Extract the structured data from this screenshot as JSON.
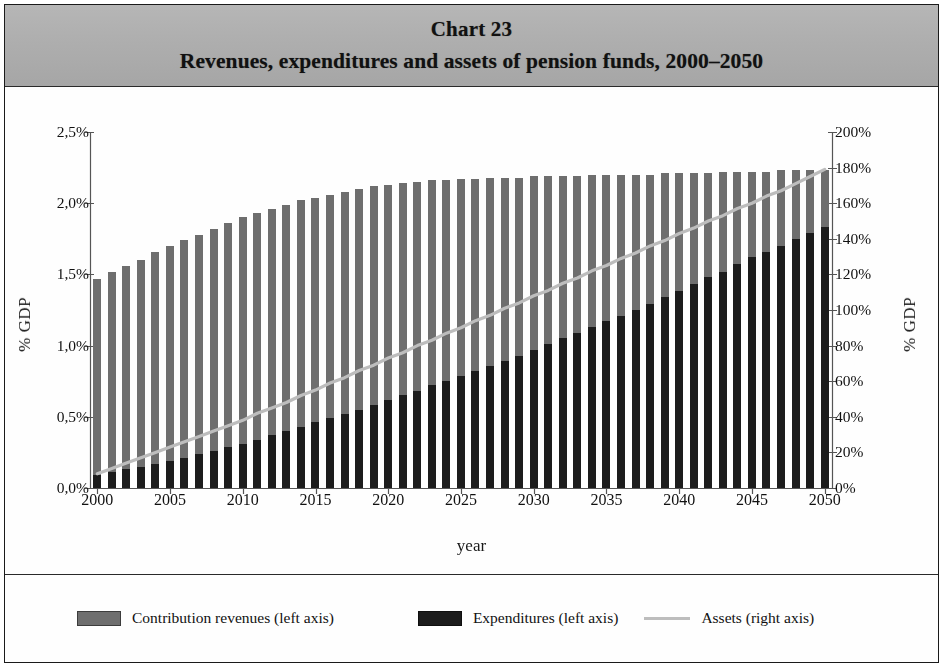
{
  "figure": {
    "title_line1": "Chart 23",
    "title_line2": "Revenues, expenditures and assets of pension funds, 2000–2050"
  },
  "axes": {
    "y_left_title": "% GDP",
    "y_right_title": "% GDP",
    "x_title": "year"
  },
  "legend": {
    "revenues_label": "Contribution revenues (left axis)",
    "expenditures_label": "Expenditures (left axis)",
    "assets_label": "Assets (right axis)"
  },
  "colors": {
    "revenues": "#6e6e6e",
    "expenditures": "#1c1c1c",
    "assets": "#bdbdbd",
    "banner": "#aeaeae",
    "frame": "#1a1a1a",
    "axis": "#555555"
  },
  "chart_data": {
    "type": "bar",
    "title": "Revenues, expenditures and assets of pension funds, 2000–2050",
    "xlabel": "year",
    "ylabel": "% GDP",
    "y2label": "% GDP",
    "grid": false,
    "legend_position": "bottom",
    "bar_mode": "overlay",
    "ylim": [
      0,
      2.5
    ],
    "y2lim": [
      0,
      200
    ],
    "y_ticks": [
      "0,0%",
      "0,5%",
      "1,0%",
      "1,5%",
      "2,0%",
      "2,5%"
    ],
    "y_tick_values": [
      0,
      0.5,
      1.0,
      1.5,
      2.0,
      2.5
    ],
    "y2_ticks": [
      "0%",
      "20%",
      "40%",
      "60%",
      "80%",
      "100%",
      "120%",
      "140%",
      "160%",
      "180%",
      "200%"
    ],
    "y2_tick_values": [
      0,
      20,
      40,
      60,
      80,
      100,
      120,
      140,
      160,
      180,
      200
    ],
    "x_tick_labels": [
      "2000",
      "2005",
      "2010",
      "2015",
      "2020",
      "2025",
      "2030",
      "2035",
      "2040",
      "2045",
      "2050"
    ],
    "x_tick_values": [
      2000,
      2005,
      2010,
      2015,
      2020,
      2025,
      2030,
      2035,
      2040,
      2045,
      2050
    ],
    "categories": [
      2000,
      2001,
      2002,
      2003,
      2004,
      2005,
      2006,
      2007,
      2008,
      2009,
      2010,
      2011,
      2012,
      2013,
      2014,
      2015,
      2016,
      2017,
      2018,
      2019,
      2020,
      2021,
      2022,
      2023,
      2024,
      2025,
      2026,
      2027,
      2028,
      2029,
      2030,
      2031,
      2032,
      2033,
      2034,
      2035,
      2036,
      2037,
      2038,
      2039,
      2040,
      2041,
      2042,
      2043,
      2044,
      2045,
      2046,
      2047,
      2048,
      2049,
      2050
    ],
    "series": [
      {
        "name": "Contribution revenues (left axis)",
        "axis": "left",
        "unit": "% GDP",
        "color": "#6e6e6e",
        "values": [
          1.47,
          1.52,
          1.56,
          1.6,
          1.66,
          1.7,
          1.74,
          1.78,
          1.82,
          1.86,
          1.9,
          1.93,
          1.96,
          1.99,
          2.02,
          2.04,
          2.06,
          2.08,
          2.1,
          2.12,
          2.13,
          2.14,
          2.15,
          2.16,
          2.16,
          2.17,
          2.17,
          2.18,
          2.18,
          2.18,
          2.19,
          2.19,
          2.19,
          2.19,
          2.2,
          2.2,
          2.2,
          2.2,
          2.2,
          2.21,
          2.21,
          2.21,
          2.21,
          2.22,
          2.22,
          2.22,
          2.22,
          2.23,
          2.23,
          2.23,
          2.23
        ]
      },
      {
        "name": "Expenditures (left axis)",
        "axis": "left",
        "unit": "% GDP",
        "color": "#1c1c1c",
        "values": [
          0.09,
          0.11,
          0.13,
          0.15,
          0.17,
          0.19,
          0.21,
          0.24,
          0.26,
          0.29,
          0.31,
          0.34,
          0.37,
          0.4,
          0.43,
          0.46,
          0.49,
          0.52,
          0.55,
          0.58,
          0.62,
          0.65,
          0.68,
          0.72,
          0.75,
          0.79,
          0.82,
          0.86,
          0.89,
          0.93,
          0.97,
          1.01,
          1.05,
          1.09,
          1.13,
          1.17,
          1.21,
          1.25,
          1.29,
          1.34,
          1.38,
          1.43,
          1.48,
          1.52,
          1.57,
          1.62,
          1.66,
          1.7,
          1.75,
          1.79,
          1.83
        ]
      },
      {
        "name": "Assets (right axis)",
        "axis": "right",
        "unit": "% GDP",
        "color": "#bdbdbd",
        "type": "line",
        "values": [
          8,
          11,
          14,
          17,
          20,
          23,
          26,
          29,
          32,
          35,
          38,
          42,
          45,
          48,
          52,
          55,
          59,
          62,
          66,
          69,
          73,
          76,
          80,
          83,
          87,
          90,
          94,
          97,
          101,
          104,
          108,
          111,
          115,
          118,
          122,
          125,
          129,
          132,
          136,
          139,
          143,
          146,
          150,
          153,
          157,
          160,
          164,
          167,
          171,
          175,
          179
        ]
      }
    ]
  }
}
